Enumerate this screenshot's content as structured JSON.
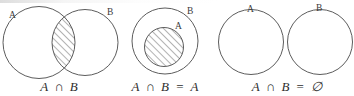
{
  "figure": {
    "background_color": "#ffffff",
    "stroke_color": "#4a4a4a",
    "label_color": "#3b3b3b",
    "caption_color": "#2e2e2e",
    "width": 354,
    "height": 96
  },
  "diagrams": [
    {
      "id": "overlapping",
      "labels": {
        "a": "A",
        "b": "B"
      },
      "caption": {
        "left": "A",
        "operator": "∩",
        "right": "B",
        "full": "A ∩ B"
      },
      "shaded_region": "intersection-lens",
      "hatched": true
    },
    {
      "id": "subset",
      "labels": {
        "a": "A",
        "b": "B"
      },
      "caption": {
        "left": "A",
        "operator": "∩",
        "right": "B",
        "equals": "=",
        "result": "A",
        "full": "A ∩ B = A"
      },
      "shaded_region": "inner-circle-a",
      "hatched": true
    },
    {
      "id": "disjoint",
      "labels": {
        "a": "A",
        "b": "B"
      },
      "caption": {
        "left": "A",
        "operator": "∩",
        "right": "B",
        "equals": "=",
        "result": "∅",
        "full": "A ∩ B = ∅"
      },
      "shaded_region": "none",
      "hatched": false
    }
  ]
}
